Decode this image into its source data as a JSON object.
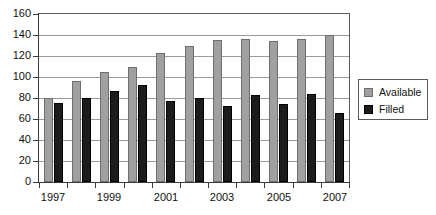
{
  "chart_data": {
    "type": "bar",
    "title": "",
    "subtitle": "",
    "xlabel": "",
    "ylabel": "",
    "ylim": [
      0,
      160
    ],
    "ytick_step": 20,
    "yticks": [
      "0",
      "20",
      "40",
      "60",
      "80",
      "100",
      "120",
      "140",
      "160"
    ],
    "grid": true,
    "legend_position": "right",
    "categories": [
      "1997",
      "1998",
      "1999",
      "2000",
      "2001",
      "2002",
      "2003",
      "2004",
      "2005",
      "2006",
      "2007"
    ],
    "xtick_labels": [
      "1997",
      "1999",
      "2001",
      "2003",
      "2005",
      "2007"
    ],
    "xtick_label_categories": [
      0,
      2,
      4,
      6,
      8,
      10
    ],
    "series": [
      {
        "name": "Available",
        "color": "#a0a0a0",
        "values": [
          80,
          96,
          105,
          110,
          123,
          130,
          135,
          136,
          134,
          136,
          140
        ]
      },
      {
        "name": "Filled",
        "color": "#1c1c1c",
        "values": [
          75,
          80,
          87,
          92,
          77,
          80,
          72,
          83,
          74,
          84,
          66
        ]
      }
    ]
  },
  "legend": {
    "entries": [
      {
        "label": "Available",
        "swatch": "available-swatch"
      },
      {
        "label": "Filled",
        "swatch": "filled-swatch"
      }
    ]
  },
  "colors": {
    "available": "#a0a0a0",
    "filled": "#1c1c1c",
    "grid": "#9a9a9a",
    "axis": "#3c3c3c",
    "background": "#ffffff"
  }
}
